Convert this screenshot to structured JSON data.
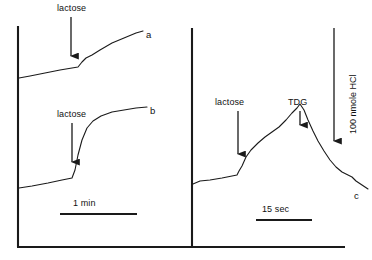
{
  "figure": {
    "kind": "chart-recorder-trace",
    "background_color": "#ffffff",
    "line_color": "#1a1a1a"
  },
  "chart_data": {
    "type": "line",
    "title": "",
    "subtitle": "",
    "xlabel": "",
    "ylabel": "",
    "grid": false,
    "legend_position": "inline-right-of-trace",
    "panels": [
      {
        "id": "left-panel",
        "time_scale_bar": {
          "label": "1 min",
          "x_start": 60,
          "x_end": 137,
          "y": 214
        },
        "axis": {
          "x_at": 18,
          "y_top": 26,
          "y_bottom": 247,
          "x_end": 176
        },
        "traces": [
          {
            "name": "a",
            "label": "a",
            "label_position": {
              "x": 146,
              "y": 31
            },
            "annotations": [
              {
                "text": "lactose",
                "label_x": 60,
                "label_y": 4,
                "arrow_x": 71,
                "arrow_y_top": 17,
                "arrow_y_bottom": 62
              }
            ],
            "points": [
              [
                19,
                78
              ],
              [
                30,
                76
              ],
              [
                45,
                73
              ],
              [
                60,
                70
              ],
              [
                72,
                68
              ],
              [
                78,
                67
              ],
              [
                82,
                62
              ],
              [
                86,
                58
              ],
              [
                92,
                55
              ],
              [
                100,
                50
              ],
              [
                112,
                43
              ],
              [
                124,
                38
              ],
              [
                136,
                33
              ],
              [
                143,
                31
              ]
            ]
          },
          {
            "name": "b",
            "label": "b",
            "label_position": {
              "x": 150,
              "y": 108
            },
            "annotations": [
              {
                "text": "lactose",
                "label_x": 58,
                "label_y": 110,
                "arrow_x": 72,
                "arrow_y_top": 123,
                "arrow_y_bottom": 168
              }
            ],
            "points": [
              [
                19,
                188
              ],
              [
                32,
                186
              ],
              [
                48,
                183
              ],
              [
                62,
                180
              ],
              [
                72,
                178
              ],
              [
                75,
                170
              ],
              [
                78,
                155
              ],
              [
                82,
                140
              ],
              [
                87,
                128
              ],
              [
                93,
                121
              ],
              [
                101,
                116
              ],
              [
                112,
                112
              ],
              [
                124,
                110
              ],
              [
                136,
                108
              ],
              [
                147,
                107
              ]
            ]
          }
        ]
      },
      {
        "id": "right-panel",
        "time_scale_bar": {
          "label": "15 sec",
          "x_start": 256,
          "x_end": 312,
          "y": 220
        },
        "axis": {
          "x_at": 192,
          "y_top": 28,
          "y_bottom": 247,
          "x_end": 345
        },
        "amplitude_scale_bar": {
          "label": "100 nmole HCl",
          "x": 334,
          "y_top": 28,
          "y_bottom": 147
        },
        "traces": [
          {
            "name": "c",
            "label": "c",
            "label_position": {
              "x": 355,
              "y": 192
            },
            "annotations": [
              {
                "text": "lactose",
                "label_x": 214,
                "label_y": 98,
                "arrow_x": 238,
                "arrow_y_top": 111,
                "arrow_y_bottom": 160
              },
              {
                "text": "TDG",
                "label_x": 288,
                "label_y": 98,
                "arrow_x": 300,
                "arrow_y_top": 111,
                "arrow_y_bottom": 131
              }
            ],
            "points": [
              [
                193,
                184
              ],
              [
                200,
                181
              ],
              [
                210,
                180
              ],
              [
                222,
                178
              ],
              [
                232,
                176
              ],
              [
                237,
                175
              ],
              [
                239,
                171
              ],
              [
                242,
                166
              ],
              [
                246,
                157
              ],
              [
                251,
                150
              ],
              [
                258,
                143
              ],
              [
                265,
                137
              ],
              [
                272,
                132
              ],
              [
                279,
                127
              ],
              [
                286,
                120
              ],
              [
                292,
                113
              ],
              [
                297,
                108
              ],
              [
                300,
                104
              ],
              [
                304,
                110
              ],
              [
                308,
                120
              ],
              [
                313,
                131
              ],
              [
                318,
                141
              ],
              [
                324,
                151
              ],
              [
                330,
                160
              ],
              [
                336,
                167
              ],
              [
                342,
                172
              ],
              [
                348,
                175
              ],
              [
                352,
                177
              ],
              [
                356,
                181
              ],
              [
                362,
                185
              ],
              [
                368,
                189
              ]
            ]
          }
        ]
      }
    ]
  }
}
